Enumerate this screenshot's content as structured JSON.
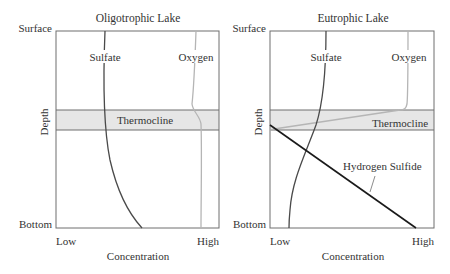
{
  "figure": {
    "panels": [
      {
        "title": "Oligotrophic Lake",
        "y_top_label": "Surface",
        "y_bottom_label": "Bottom",
        "y_axis_label": "Depth",
        "x_low_label": "Low",
        "x_high_label": "High",
        "x_axis_label": "Concentration",
        "band_label": "Thermocline",
        "curves": [
          {
            "name": "Sulfate",
            "color": "#4a4a4a"
          },
          {
            "name": "Oxygen",
            "color": "#b5b5b5"
          }
        ]
      },
      {
        "title": "Eutrophic Lake",
        "y_top_label": "Surface",
        "y_bottom_label": "Bottom",
        "y_axis_label": "Depth",
        "x_low_label": "Low",
        "x_high_label": "High",
        "x_axis_label": "Concentration",
        "band_label": "Thermocline",
        "curves": [
          {
            "name": "Sulfate",
            "color": "#4a4a4a"
          },
          {
            "name": "Oxygen",
            "color": "#b5b5b5"
          },
          {
            "name": "Hydrogen Sulfide",
            "color": "#1a1a1a"
          }
        ]
      }
    ],
    "colors": {
      "frame": "#6e6e6e",
      "band_fill": "#e6e6e6",
      "text": "#333333"
    }
  }
}
